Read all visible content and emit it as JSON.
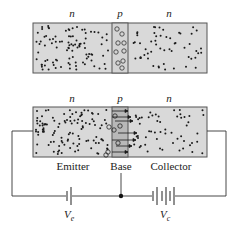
{
  "diagram": {
    "top_panel": {
      "region_labels": [
        "n",
        "p",
        "n"
      ],
      "description": "unbiased npn structure: electrons (dots) in n regions, holes (circles) in p region"
    },
    "bottom_panel": {
      "region_labels": [
        "n",
        "p",
        "n"
      ],
      "terminal_labels": [
        "Emitter",
        "Base",
        "Collector"
      ],
      "description": "biased transistor: electrons flow from emitter through base into collector (arrows)"
    },
    "circuit": {
      "emitter_battery_label": "V",
      "emitter_battery_sub": "e",
      "collector_battery_label": "V",
      "collector_battery_sub": "c"
    },
    "colors": {
      "semiconductor_fill": "#d9d9d9",
      "base_fill_biased": "#b8b8b8",
      "outline": "#555555",
      "carrier": "#1a1a1a",
      "wire": "#333333"
    }
  }
}
